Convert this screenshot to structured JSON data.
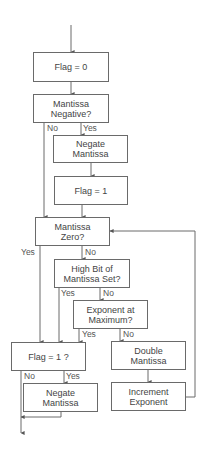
{
  "diagram": {
    "type": "flowchart",
    "line_color": "#6a6a6a",
    "text_color": "#444444",
    "nodes": {
      "flag0": {
        "line1": "Flag = 0",
        "line2": ""
      },
      "neg_q": {
        "line1": "Mantissa",
        "line2": "Negative?"
      },
      "negate1": {
        "line1": "Negate",
        "line2": "Mantissa"
      },
      "flag1": {
        "line1": "Flag = 1",
        "line2": ""
      },
      "zero_q": {
        "line1": "Mantissa",
        "line2": "Zero?"
      },
      "highbit_q": {
        "line1": "High Bit of",
        "line2": "Mantissa Set?"
      },
      "expmax_q": {
        "line1": "Exponent at",
        "line2": "Maximum?"
      },
      "flag1_q": {
        "line1": "Flag = 1 ?",
        "line2": ""
      },
      "double": {
        "line1": "Double",
        "line2": "Mantissa"
      },
      "negate2": {
        "line1": "Negate",
        "line2": "Mantissa"
      },
      "increment": {
        "line1": "Increment",
        "line2": "Exponent"
      }
    },
    "labels": {
      "neg_no": "No",
      "neg_yes": "Yes",
      "zero_yes": "Yes",
      "zero_no": "No",
      "highbit_yes": "Yes",
      "highbit_no": "No",
      "expmax_yes": "Yes",
      "expmax_no": "No",
      "flag1q_no": "No",
      "flag1q_yes": "Yes"
    }
  }
}
